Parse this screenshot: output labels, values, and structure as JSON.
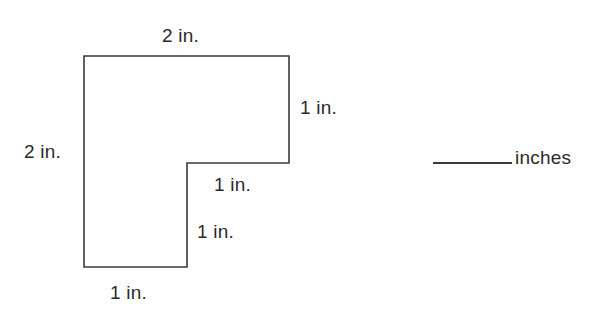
{
  "figure": {
    "stroke_color": "#3a3a3a",
    "fill_color": "#ffffff",
    "text_color": "#2b2b2b",
    "polygon_points": "84,56 289,56 289,163 187,163 187,267 84,267",
    "labels": {
      "top": "2 in.",
      "left": "2 in.",
      "right": "1 in.",
      "notch_horizontal": "1 in.",
      "notch_vertical": "1 in.",
      "bottom": "1 in."
    }
  },
  "answer": {
    "blank": "",
    "units": "inches"
  },
  "chart_data": {
    "type": "diagram",
    "shape": "L-shape polygon",
    "title": "",
    "vertices": [
      [
        84,
        56
      ],
      [
        289,
        56
      ],
      [
        289,
        163
      ],
      [
        187,
        163
      ],
      [
        187,
        267
      ],
      [
        84,
        267
      ]
    ],
    "side_lengths_in": [
      2,
      1,
      1,
      1,
      1,
      2
    ],
    "side_labels": [
      "2 in.",
      "1 in.",
      "1 in.",
      "1 in.",
      "1 in.",
      "2 in."
    ],
    "units": "inches",
    "grid": false,
    "legend": "none"
  }
}
